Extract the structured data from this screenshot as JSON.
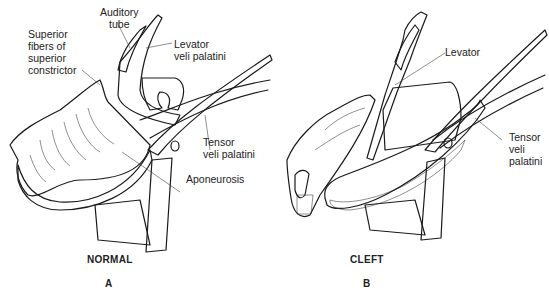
{
  "figure": {
    "panels": [
      {
        "id": "A",
        "caption": "NORMAL",
        "letter": "A",
        "labels": {
          "auditory_tube": [
            "Auditory",
            "tube"
          ],
          "superior_fibers": [
            "Superior",
            "fibers of",
            "superior",
            "constrictor"
          ],
          "levator": [
            "Levator",
            "veli palatini"
          ],
          "tensor": [
            "Tensor",
            "veli palatini"
          ],
          "aponeurosis": "Aponeurosis"
        }
      },
      {
        "id": "B",
        "caption": "CLEFT",
        "letter": "B",
        "labels": {
          "levator": "Levator",
          "tensor": [
            "Tensor",
            "veli",
            "palatini"
          ]
        }
      }
    ],
    "colors": {
      "line": "#1a1a1a",
      "background": "#ffffff",
      "shade": "#7a7a7a"
    }
  }
}
